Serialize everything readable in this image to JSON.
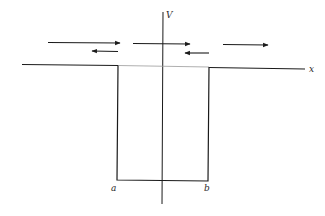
{
  "diagram": {
    "type": "square potential well",
    "axes": {
      "vertical_label": "V",
      "horizontal_label": "x"
    },
    "well": {
      "left_edge_label": "a",
      "right_edge_label": "b"
    },
    "waves": {
      "incoming_direction": "right",
      "regions": [
        {
          "region": "left of well",
          "arrows": [
            "right",
            "left"
          ]
        },
        {
          "region": "inside well",
          "arrows": [
            "right",
            "left"
          ]
        },
        {
          "region": "right of well",
          "arrows": [
            "right"
          ]
        }
      ]
    },
    "colors": {
      "line": "#1a1a1a",
      "faint_line": "#9a9a9a",
      "background": "#ffffff"
    }
  }
}
